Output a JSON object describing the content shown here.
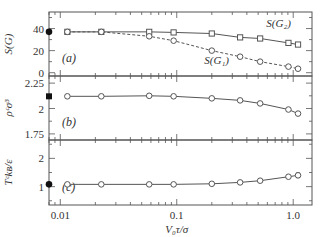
{
  "figure": {
    "xlabel": "V₀τ/σ",
    "x_ticks": [
      "0.01",
      "0.1",
      "1.0"
    ]
  },
  "chart_data": [
    {
      "type": "line",
      "panel_label": "(a)",
      "ylabel": "S(G)",
      "xscale": "log",
      "xlim": [
        0.008,
        1.45
      ],
      "ylim": [
        -3,
        55
      ],
      "y_ticks": [
        "0",
        "20",
        "40"
      ],
      "y_tick_values": [
        0,
        20,
        40
      ],
      "x": [
        0.0115,
        0.0225,
        0.058,
        0.094,
        0.2,
        0.35,
        0.52,
        0.91,
        1.1
      ],
      "series": [
        {
          "name": "S(G₂)",
          "marker": "square",
          "line": "solid",
          "values": [
            37,
            37,
            37,
            36.5,
            35.5,
            32,
            31,
            27,
            25.5
          ]
        },
        {
          "name": "S(G₁)",
          "marker": "circle",
          "line": "dashed",
          "values": [
            37,
            37,
            33,
            29,
            20,
            14.5,
            10,
            5.5,
            3.6
          ]
        }
      ],
      "reference_point": {
        "x": 0.008,
        "y": 37,
        "marker": "filled-circle"
      },
      "annotations": [
        {
          "text": "S(G₂)",
          "x": 0.75,
          "y": 41
        },
        {
          "text": "S(G₁)",
          "x": 0.22,
          "y": 8
        }
      ]
    },
    {
      "type": "line",
      "panel_label": "(b)",
      "ylabel": "ρᶜσ³",
      "xscale": "log",
      "xlim": [
        0.008,
        1.45
      ],
      "ylim": [
        1.69,
        2.32
      ],
      "y_ticks": [
        "1.75",
        "2",
        "2.25"
      ],
      "y_tick_values": [
        1.75,
        2.0,
        2.25
      ],
      "x": [
        0.0115,
        0.0225,
        0.058,
        0.094,
        0.2,
        0.35,
        0.52,
        0.91,
        1.1
      ],
      "series": [
        {
          "name": "ρcσ³",
          "marker": "circle",
          "line": "solid",
          "values": [
            2.12,
            2.12,
            2.125,
            2.12,
            2.1,
            2.08,
            2.05,
            1.99,
            1.95
          ],
          "errors": [
            0.012,
            0,
            0,
            0,
            0,
            0,
            0,
            0,
            0.018
          ]
        }
      ],
      "reference_point": {
        "x": 0.008,
        "y": 2.12,
        "marker": "filled-square"
      }
    },
    {
      "type": "line",
      "panel_label": "(c)",
      "ylabel": "Tᶜkʙ/ε",
      "xscale": "log",
      "xlim": [
        0.008,
        1.45
      ],
      "ylim": [
        0.35,
        2.65
      ],
      "y_ticks": [
        "1",
        "2"
      ],
      "y_tick_values": [
        1,
        2
      ],
      "x": [
        0.0115,
        0.0225,
        0.058,
        0.094,
        0.2,
        0.35,
        0.52,
        0.91,
        1.1
      ],
      "series": [
        {
          "name": "Tckʙ/ε",
          "marker": "circle",
          "line": "solid",
          "values": [
            1.08,
            1.08,
            1.08,
            1.08,
            1.1,
            1.15,
            1.21,
            1.35,
            1.4
          ],
          "errors": [
            0,
            0,
            0,
            0,
            0,
            0,
            0,
            0,
            0.08
          ]
        }
      ],
      "reference_point": {
        "x": 0.008,
        "y": 1.08,
        "marker": "filled-circle"
      }
    }
  ]
}
